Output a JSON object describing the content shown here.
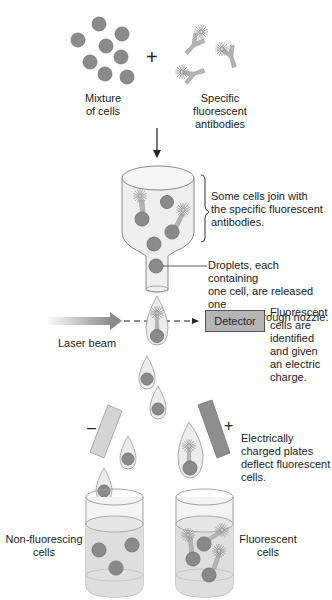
{
  "diagram": {
    "labels": {
      "mixture": "Mixture\nof cells",
      "mixture_l1": "Mixture",
      "mixture_l2": "of cells",
      "plus": "+",
      "antibodies_l1": "Specific",
      "antibodies_l2": "fluorescent",
      "antibodies_l3": "antibodies",
      "join_l1": "Some cells join with",
      "join_l2": "the specific fluorescent",
      "join_l3": "antibodies.",
      "droplets_l1": "Droplets, each containing",
      "droplets_l2": "one cell, are released one",
      "droplets_l3": "at a time through nozzle.",
      "laser": "Laser beam",
      "detector": "Detector",
      "fluor_l1": "Fluorescent",
      "fluor_l2": "cells are",
      "fluor_l3": "identified",
      "fluor_l4": "and given",
      "fluor_l5": "an electric",
      "fluor_l6": "charge.",
      "minus": "–",
      "plus_plate": "+",
      "plates_l1": "Electrically",
      "plates_l2": "charged plates",
      "plates_l3": "deflect fluorescent",
      "plates_l4": "cells.",
      "nonfluor_l1": "Non-fluorescing",
      "nonfluor_l2": "cells",
      "fluorcells_l1": "Fluorescent",
      "fluorcells_l2": "cells"
    },
    "colors": {
      "cell": "#8a8a8a",
      "cell_stroke": "#6e6e6e",
      "antibody": "#b4b4b4",
      "container": "#efefef",
      "liquid": "#dedede",
      "negative_plate": "#d4d4d4",
      "positive_plate": "#8e8e8e",
      "detector": "#b5b5b5"
    }
  }
}
